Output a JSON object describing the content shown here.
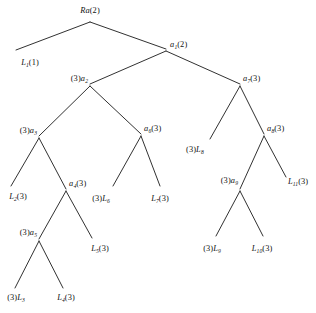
{
  "figure": {
    "kind": "binary-tree-diagram",
    "background_color": "#ffffff",
    "line_color": "#1a1a1a",
    "text_color": "#111111",
    "width": 316,
    "height": 313
  },
  "nodes": [
    {
      "id": "root",
      "label_prefix": "Ra",
      "label_sub": "",
      "label_suffix": "(2)",
      "text": "Ra(2)",
      "x": 90,
      "y": 20,
      "anchor": "c",
      "label_x": 90,
      "label_y": 11,
      "kind": "internal"
    },
    {
      "id": "L1",
      "label_prefix": "L",
      "label_sub": "1",
      "label_suffix": "(1)",
      "text": "L1(1)",
      "x": 22,
      "y": 52,
      "anchor": "c",
      "label_x": 30,
      "label_y": 63,
      "kind": "leaf"
    },
    {
      "id": "a1",
      "label_prefix": "a",
      "label_sub": "1",
      "label_suffix": "(2)",
      "text": "a1(2)",
      "x": 166,
      "y": 50,
      "anchor": "l",
      "label_x": 170,
      "label_y": 45,
      "kind": "internal"
    },
    {
      "id": "a2",
      "label_prefix": "a",
      "label_sub": "2",
      "label_suffix": "",
      "text": "(3)a2",
      "x": 90,
      "y": 85,
      "anchor": "r",
      "label_x": 88,
      "label_y": 79,
      "kind": "internal",
      "pre": "(3)"
    },
    {
      "id": "a7",
      "label_prefix": "a",
      "label_sub": "7",
      "label_suffix": "(3)",
      "text": "a7(3)",
      "x": 240,
      "y": 85,
      "anchor": "l",
      "label_x": 243,
      "label_y": 79,
      "kind": "internal"
    },
    {
      "id": "a3",
      "label_prefix": "a",
      "label_sub": "3",
      "label_suffix": "",
      "text": "(3)a3",
      "x": 39,
      "y": 137,
      "anchor": "r",
      "label_x": 37,
      "label_y": 131,
      "kind": "internal",
      "pre": "(3)"
    },
    {
      "id": "a6",
      "label_prefix": "a",
      "label_sub": "6",
      "label_suffix": "(3)",
      "text": "a6(3)",
      "x": 141,
      "y": 135,
      "anchor": "l",
      "label_x": 144,
      "label_y": 129,
      "kind": "internal"
    },
    {
      "id": "L8",
      "label_prefix": "L",
      "label_sub": "8",
      "label_suffix": "",
      "text": "(3)L8",
      "x": 210,
      "y": 140,
      "anchor": "l",
      "label_x": 186,
      "label_y": 150,
      "kind": "leaf",
      "pre": "(3)"
    },
    {
      "id": "a8",
      "label_prefix": "a",
      "label_sub": "8",
      "label_suffix": "(3)",
      "text": "a8(3)",
      "x": 264,
      "y": 135,
      "anchor": "l",
      "label_x": 267,
      "label_y": 129,
      "kind": "internal"
    },
    {
      "id": "L2",
      "label_prefix": "L",
      "label_sub": "2",
      "label_suffix": "(3)",
      "text": "L2(3)",
      "x": 14,
      "y": 190,
      "anchor": "c",
      "label_x": 18,
      "label_y": 197,
      "kind": "leaf"
    },
    {
      "id": "a4",
      "label_prefix": "a",
      "label_sub": "4",
      "label_suffix": "(3)",
      "text": "a4(3)",
      "x": 66,
      "y": 190,
      "anchor": "l",
      "label_x": 69,
      "label_y": 184,
      "kind": "internal"
    },
    {
      "id": "L6",
      "label_prefix": "L",
      "label_sub": "6",
      "label_suffix": "",
      "text": "(3)L6",
      "x": 110,
      "y": 190,
      "anchor": "c",
      "label_x": 101,
      "label_y": 199,
      "kind": "leaf",
      "pre": "(3)"
    },
    {
      "id": "L7",
      "label_prefix": "L",
      "label_sub": "7",
      "label_suffix": "(3)",
      "text": "L7(3)",
      "x": 158,
      "y": 190,
      "anchor": "c",
      "label_x": 160,
      "label_y": 199,
      "kind": "leaf"
    },
    {
      "id": "a9",
      "label_prefix": "a",
      "label_sub": "9",
      "label_suffix": "",
      "text": "(3)a9",
      "x": 240,
      "y": 190,
      "anchor": "r",
      "label_x": 238,
      "label_y": 181,
      "kind": "internal",
      "pre": "(3)"
    },
    {
      "id": "L11",
      "label_prefix": "L",
      "label_sub": "11",
      "label_suffix": "(3)",
      "text": "L11(3)",
      "x": 288,
      "y": 178,
      "anchor": "l",
      "label_x": 288,
      "label_y": 182,
      "kind": "leaf"
    },
    {
      "id": "a5",
      "label_prefix": "a",
      "label_sub": "5",
      "label_suffix": "",
      "text": "(3)a5",
      "x": 39,
      "y": 240,
      "anchor": "r",
      "label_x": 37,
      "label_y": 233,
      "kind": "internal",
      "pre": "(3)"
    },
    {
      "id": "L5",
      "label_prefix": "L",
      "label_sub": "5",
      "label_suffix": "(3)",
      "text": "L5(3)",
      "x": 92,
      "y": 240,
      "anchor": "c",
      "label_x": 100,
      "label_y": 249,
      "kind": "leaf"
    },
    {
      "id": "L9",
      "label_prefix": "L",
      "label_sub": "9",
      "label_suffix": "",
      "text": "(3)L9",
      "x": 214,
      "y": 240,
      "anchor": "c",
      "label_x": 212,
      "label_y": 249,
      "kind": "leaf",
      "pre": "(3)"
    },
    {
      "id": "L10",
      "label_prefix": "L",
      "label_sub": "10",
      "label_suffix": "(3)",
      "text": "L10(3)",
      "x": 262,
      "y": 240,
      "anchor": "c",
      "label_x": 262,
      "label_y": 249,
      "kind": "leaf"
    },
    {
      "id": "L3",
      "label_prefix": "L",
      "label_sub": "3",
      "label_suffix": "",
      "text": "(3)L3",
      "x": 14,
      "y": 290,
      "anchor": "c",
      "label_x": 16,
      "label_y": 298,
      "kind": "leaf",
      "pre": "(3)"
    },
    {
      "id": "L4",
      "label_prefix": "L",
      "label_sub": "4",
      "label_suffix": "(3)",
      "text": "L4(3)",
      "x": 64,
      "y": 290,
      "anchor": "c",
      "label_x": 66,
      "label_y": 298,
      "kind": "leaf"
    }
  ],
  "edges": [
    {
      "from": "root",
      "to": "L1",
      "x1": 90,
      "y1": 22,
      "x2": 16,
      "y2": 50
    },
    {
      "from": "root",
      "to": "a1",
      "x1": 90,
      "y1": 22,
      "x2": 166,
      "y2": 49
    },
    {
      "from": "a1",
      "to": "a2",
      "x1": 166,
      "y1": 51,
      "x2": 90,
      "y2": 84
    },
    {
      "from": "a1",
      "to": "a7",
      "x1": 166,
      "y1": 51,
      "x2": 240,
      "y2": 84
    },
    {
      "from": "a2",
      "to": "a3",
      "x1": 90,
      "y1": 86,
      "x2": 39,
      "y2": 136
    },
    {
      "from": "a2",
      "to": "a6",
      "x1": 90,
      "y1": 86,
      "x2": 141,
      "y2": 134
    },
    {
      "from": "a3",
      "to": "L2",
      "x1": 39,
      "y1": 138,
      "x2": 11,
      "y2": 186
    },
    {
      "from": "a3",
      "to": "a4",
      "x1": 39,
      "y1": 138,
      "x2": 66,
      "y2": 189
    },
    {
      "from": "a4",
      "to": "a5",
      "x1": 66,
      "y1": 191,
      "x2": 39,
      "y2": 239
    },
    {
      "from": "a4",
      "to": "L5",
      "x1": 66,
      "y1": 191,
      "x2": 92,
      "y2": 238
    },
    {
      "from": "a5",
      "to": "L3",
      "x1": 39,
      "y1": 241,
      "x2": 15,
      "y2": 288
    },
    {
      "from": "a5",
      "to": "L4",
      "x1": 39,
      "y1": 241,
      "x2": 63,
      "y2": 288
    },
    {
      "from": "a6",
      "to": "L6",
      "x1": 141,
      "y1": 136,
      "x2": 113,
      "y2": 186
    },
    {
      "from": "a6",
      "to": "L7",
      "x1": 141,
      "y1": 136,
      "x2": 160,
      "y2": 186
    },
    {
      "from": "a7",
      "to": "L8",
      "x1": 240,
      "y1": 86,
      "x2": 210,
      "y2": 139
    },
    {
      "from": "a7",
      "to": "a8",
      "x1": 240,
      "y1": 86,
      "x2": 264,
      "y2": 134
    },
    {
      "from": "a8",
      "to": "a9",
      "x1": 264,
      "y1": 136,
      "x2": 240,
      "y2": 189
    },
    {
      "from": "a8",
      "to": "L11",
      "x1": 264,
      "y1": 136,
      "x2": 286,
      "y2": 177
    },
    {
      "from": "a9",
      "to": "L9",
      "x1": 240,
      "y1": 191,
      "x2": 216,
      "y2": 236
    },
    {
      "from": "a9",
      "to": "L10",
      "x1": 240,
      "y1": 191,
      "x2": 263,
      "y2": 236
    }
  ]
}
